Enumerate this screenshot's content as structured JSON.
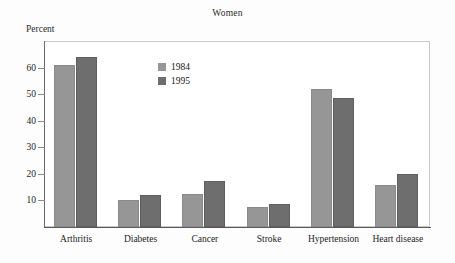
{
  "chart_data": {
    "type": "bar",
    "title": "Women",
    "xlabel": "",
    "ylabel": "Percent",
    "categories": [
      "Arthritis",
      "Diabetes",
      "Cancer",
      "Stroke",
      "Hypertension",
      "Heart disease"
    ],
    "series": [
      {
        "name": "1984",
        "color": "#969696",
        "values": [
          61.0,
          10.2,
          12.4,
          7.6,
          51.8,
          15.8
        ]
      },
      {
        "name": "1995",
        "color": "#6e6e6e",
        "values": [
          63.8,
          12.2,
          17.4,
          8.7,
          48.7,
          20.0
        ]
      }
    ],
    "yticks": [
      10,
      20,
      30,
      40,
      50,
      60
    ],
    "ylim": [
      0,
      70
    ],
    "grid": false,
    "legend_position": "inside-top-left"
  },
  "axis": {
    "ytick_labels": [
      "10",
      "20",
      "30",
      "40",
      "50",
      "60"
    ]
  },
  "legend": {
    "items": [
      {
        "label": "1984",
        "color": "#969696"
      },
      {
        "label": "1995",
        "color": "#6e6e6e"
      }
    ]
  }
}
